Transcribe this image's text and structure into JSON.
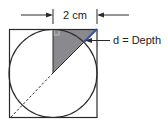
{
  "diagram": {
    "dimension_label": "2 cm",
    "depth_label": "d = Depth",
    "colors": {
      "stroke": "#2a2a2a",
      "shade": "#8a8a8e",
      "depth_segment": "#3a4fa8",
      "background": "#ffffff"
    },
    "shapes": {
      "square": "outer square",
      "circle": "inscribed circle",
      "shaded_triangle": "right triangle from top-center to top-right corner to circle center",
      "right_angle_marker": "small square at top-center",
      "dashed_line": "diagonal from circle center to bottom-left corner",
      "depth_segment": "segment from circle to top-right corner"
    }
  }
}
